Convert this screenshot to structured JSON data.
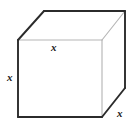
{
  "figure": {
    "kind": "cube-diagram",
    "background_color": "#ffffff",
    "outer_edge_color": "#2b2b2b",
    "inner_edge_color": "#b6b6b6",
    "label_color": "#1a1a1a",
    "labels": {
      "top_edge": "x",
      "left_edge": "x",
      "right_diagonal_edge": "x"
    },
    "geometry": {
      "front_top_left": [
        18,
        40
      ],
      "front_top_right": [
        102,
        40
      ],
      "front_bottom_right": [
        102,
        117
      ],
      "front_bottom_left": [
        18,
        117
      ],
      "back_top_left": [
        44,
        11
      ],
      "back_top_right": [
        125,
        11
      ],
      "back_bottom_right": [
        125,
        88
      ]
    }
  }
}
